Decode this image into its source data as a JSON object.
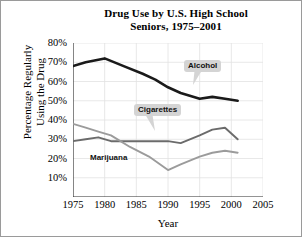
{
  "chart_data": {
    "type": "line",
    "title": "Drug Use by U.S. High School Seniors, 1975–2001",
    "title_line1": "Drug Use by U.S. High School",
    "title_line2": "Seniors, 1975–2001",
    "xlabel": "Year",
    "ylabel": "Percentage Regularly Using the Drug",
    "ylabel_line1": "Percentage Regularly",
    "ylabel_line2": "Using the Drug",
    "xlim": [
      1975,
      2005
    ],
    "ylim": [
      0,
      80
    ],
    "xticks": [
      "1975",
      "1980",
      "1985",
      "1990",
      "1995",
      "2000",
      "2005"
    ],
    "xtick_values": [
      1975,
      1980,
      1985,
      1990,
      1995,
      2000,
      2005
    ],
    "yticks": [
      "10%",
      "20%",
      "30%",
      "40%",
      "50%",
      "60%",
      "70%",
      "80%"
    ],
    "ytick_values": [
      10,
      20,
      30,
      40,
      50,
      60,
      70,
      80
    ],
    "grid": "horizontal-and-vertical",
    "legend_position": "inline-callouts",
    "series": [
      {
        "name": "Alcohol",
        "color": "#1a1a1a",
        "width": 2.6,
        "x": [
          1975,
          1977,
          1980,
          1983,
          1986,
          1988,
          1990,
          1992,
          1995,
          1997,
          1999,
          2001
        ],
        "values": [
          68,
          70,
          72,
          68,
          64,
          61,
          57,
          54,
          51,
          52,
          51,
          50
        ]
      },
      {
        "name": "Cigarettes",
        "color": "#6b6b6b",
        "width": 1.9,
        "x": [
          1975,
          1977,
          1979,
          1981,
          1984,
          1987,
          1990,
          1992,
          1995,
          1997,
          1999,
          2001
        ],
        "values": [
          29,
          30,
          31,
          29,
          29,
          29,
          29,
          28,
          32,
          35,
          36,
          30
        ]
      },
      {
        "name": "Marijuana",
        "color": "#9b9b9b",
        "width": 1.9,
        "x": [
          1975,
          1977,
          1979,
          1981,
          1984,
          1987,
          1990,
          1992,
          1995,
          1997,
          1999,
          2001
        ],
        "values": [
          38,
          36,
          34,
          32,
          26,
          21,
          14,
          17,
          21,
          23,
          24,
          23
        ]
      }
    ],
    "annotations": [
      {
        "text": "Alcohol",
        "style": "callout"
      },
      {
        "text": "Cigarettes",
        "style": "callout"
      },
      {
        "text": "Marijuana",
        "style": "plain"
      }
    ]
  }
}
